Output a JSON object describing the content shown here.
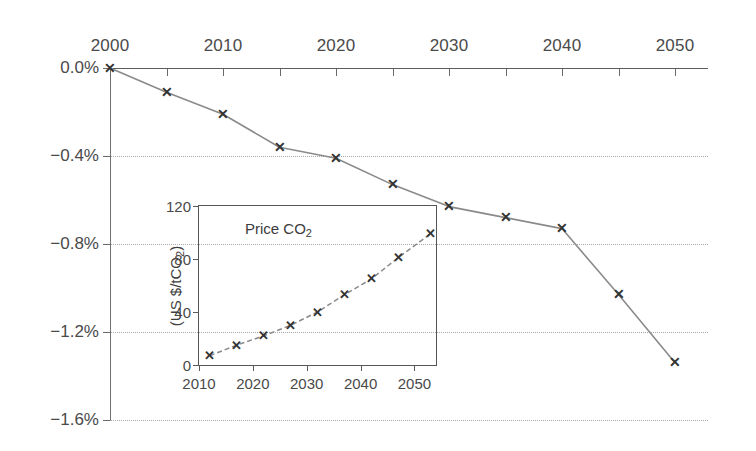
{
  "chart_data": [
    {
      "id": "main",
      "type": "line",
      "title": "",
      "xlabel": "",
      "ylabel": "",
      "x": [
        2000,
        2005,
        2010,
        2015,
        2020,
        2025,
        2030,
        2035,
        2040,
        2045,
        2050
      ],
      "values": [
        0.0,
        -0.11,
        -0.21,
        -0.36,
        -0.41,
        -0.53,
        -0.63,
        -0.68,
        -0.73,
        -1.03,
        -1.34
      ],
      "xlim": [
        2000,
        2050
      ],
      "ylim": [
        -1.6,
        0.0
      ],
      "xticks": [
        2000,
        2005,
        2010,
        2015,
        2020,
        2025,
        2030,
        2035,
        2040,
        2045,
        2050
      ],
      "xticklabels": [
        "2000",
        "",
        "2010",
        "",
        "2020",
        "",
        "2030",
        "",
        "2040",
        "",
        "2050"
      ],
      "yticks": [
        0.0,
        -0.4,
        -0.8,
        -1.2,
        -1.6
      ],
      "yticklabels": [
        "0.0%",
        "−0.4%",
        "−0.8%",
        "−1.2%",
        "−1.6%"
      ],
      "grid": true,
      "marker": "x",
      "legend": "none",
      "xaxis_position": "top"
    },
    {
      "id": "inset",
      "type": "line",
      "title": "Price CO2",
      "title_display": "Price CO",
      "title_sub": "2",
      "xlabel": "",
      "ylabel": "(US $/tCO2)",
      "ylabel_display": "(US $/tCO",
      "ylabel_sub": "2",
      "ylabel_suffix": ")",
      "x": [
        2012,
        2017,
        2022,
        2027,
        2032,
        2037,
        2042,
        2047,
        2053
      ],
      "values": [
        7,
        15,
        22,
        30,
        40,
        53,
        65,
        81,
        99
      ],
      "xlim": [
        2010,
        2054
      ],
      "ylim": [
        0,
        120
      ],
      "xticks": [
        2010,
        2020,
        2030,
        2040,
        2050
      ],
      "xticklabels": [
        "2010",
        "2020",
        "2030",
        "2040",
        "2050"
      ],
      "yticks": [
        0,
        40,
        80,
        120
      ],
      "yticklabels": [
        "0",
        "40",
        "80",
        "120"
      ],
      "grid": false,
      "marker": "x",
      "legend": "none"
    }
  ],
  "colors": {
    "line": "#8a8a8a",
    "marker": "#333333",
    "axis": "#5c5c5c",
    "grid": "#a8a8a8",
    "text": "#444444",
    "background": "#ffffff"
  },
  "marker_glyph": "✕"
}
